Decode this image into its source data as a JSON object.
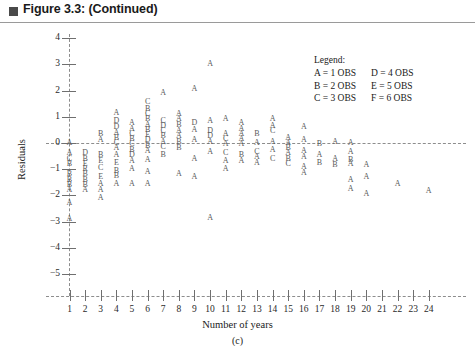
{
  "header": {
    "title": "Figure 3.3:  (Continued)",
    "bullet_icon": "filled-square-icon"
  },
  "legend": {
    "title": "Legend:",
    "rows": [
      {
        "left": "A = 1 OBS",
        "right": "D = 4 OBS"
      },
      {
        "left": "B = 2 OBS",
        "right": "E = 5 OBS"
      },
      {
        "left": "C = 3 OBS",
        "right": "F = 6 OBS"
      }
    ]
  },
  "axes": {
    "y_title": "Residuals",
    "x_title": "Number of years",
    "sub_caption": "(c)",
    "y_ticks": [
      4,
      3,
      2,
      1,
      0,
      -1,
      -2,
      -3,
      -4,
      -5
    ],
    "y_tick_labels": [
      "4",
      "3",
      "2",
      "1",
      "0",
      "−1",
      "−2",
      "−3",
      "−4",
      "−5"
    ],
    "x_ticks": [
      1,
      2,
      3,
      4,
      5,
      6,
      7,
      8,
      9,
      10,
      11,
      12,
      13,
      14,
      15,
      16,
      17,
      18,
      19,
      20,
      21,
      22,
      23,
      24
    ],
    "x_tick_labels": [
      "1",
      "2",
      "3",
      "4",
      "5",
      "6",
      "7",
      "8",
      "9",
      "10",
      "11",
      "12",
      "13",
      "14",
      "15",
      "16",
      "17",
      "18",
      "19",
      "20",
      "21",
      "22",
      "23",
      "24"
    ]
  },
  "chart_data": {
    "type": "scatter",
    "title": "Figure 3.3:  (Continued)",
    "xlabel": "Number of years",
    "ylabel": "Residuals",
    "sub_caption": "(c)",
    "xlim": [
      0.5,
      24.5
    ],
    "ylim": [
      -5.4,
      4.4
    ],
    "grid": false,
    "legend_position": "top-right",
    "legend_entries": [
      {
        "code": "A",
        "count": 1,
        "label": "A = 1 OBS"
      },
      {
        "code": "B",
        "count": 2,
        "label": "B = 2 OBS"
      },
      {
        "code": "C",
        "count": 3,
        "label": "C = 3 OBS"
      },
      {
        "code": "D",
        "count": 4,
        "label": "D = 4 OBS"
      },
      {
        "code": "E",
        "count": 5,
        "label": "E = 5 OBS"
      },
      {
        "code": "F",
        "count": 6,
        "label": "F = 6 OBS"
      }
    ],
    "annotations": [
      {
        "type": "reference-line",
        "axis": "y",
        "value": 0,
        "style": "dashed"
      }
    ],
    "points": [
      {
        "x": 1,
        "y": 0.0,
        "code": "A"
      },
      {
        "x": 1,
        "y": -0.4,
        "code": "A"
      },
      {
        "x": 1,
        "y": -0.6,
        "code": "C"
      },
      {
        "x": 1,
        "y": -0.8,
        "code": "B"
      },
      {
        "x": 1,
        "y": -1.2,
        "code": "B"
      },
      {
        "x": 1,
        "y": -1.4,
        "code": "B"
      },
      {
        "x": 1,
        "y": -1.6,
        "code": "B"
      },
      {
        "x": 1,
        "y": -1.8,
        "code": "A"
      },
      {
        "x": 1,
        "y": -2.3,
        "code": "A"
      },
      {
        "x": 1,
        "y": -2.9,
        "code": "A"
      },
      {
        "x": 2,
        "y": -0.4,
        "code": "D"
      },
      {
        "x": 2,
        "y": -0.6,
        "code": "B"
      },
      {
        "x": 2,
        "y": -0.8,
        "code": "E"
      },
      {
        "x": 2,
        "y": -1.0,
        "code": "R"
      },
      {
        "x": 2,
        "y": -1.2,
        "code": "B"
      },
      {
        "x": 2,
        "y": -1.4,
        "code": "B"
      },
      {
        "x": 2,
        "y": -1.6,
        "code": "B"
      },
      {
        "x": 2,
        "y": -1.8,
        "code": "A"
      },
      {
        "x": 3,
        "y": 0.35,
        "code": "B"
      },
      {
        "x": 3,
        "y": 0.1,
        "code": "A"
      },
      {
        "x": 3,
        "y": -0.45,
        "code": "B"
      },
      {
        "x": 3,
        "y": -0.7,
        "code": "E"
      },
      {
        "x": 3,
        "y": -0.95,
        "code": "C"
      },
      {
        "x": 3,
        "y": -1.3,
        "code": "E"
      },
      {
        "x": 3,
        "y": -1.55,
        "code": "A"
      },
      {
        "x": 3,
        "y": -1.8,
        "code": "A"
      },
      {
        "x": 3,
        "y": -2.1,
        "code": "A"
      },
      {
        "x": 4,
        "y": 1.15,
        "code": "A"
      },
      {
        "x": 4,
        "y": 0.85,
        "code": "D"
      },
      {
        "x": 4,
        "y": 0.6,
        "code": "D"
      },
      {
        "x": 4,
        "y": 0.4,
        "code": "A"
      },
      {
        "x": 4,
        "y": 0.2,
        "code": "B"
      },
      {
        "x": 4,
        "y": 0.0,
        "code": "C"
      },
      {
        "x": 4,
        "y": -0.2,
        "code": "A"
      },
      {
        "x": 4,
        "y": -0.45,
        "code": "A"
      },
      {
        "x": 4,
        "y": -0.75,
        "code": "E"
      },
      {
        "x": 4,
        "y": -1.05,
        "code": "B"
      },
      {
        "x": 4,
        "y": -1.25,
        "code": "B"
      },
      {
        "x": 4,
        "y": -1.55,
        "code": "A"
      },
      {
        "x": 5,
        "y": 0.75,
        "code": "A"
      },
      {
        "x": 5,
        "y": 0.55,
        "code": "A"
      },
      {
        "x": 5,
        "y": 0.35,
        "code": "C"
      },
      {
        "x": 5,
        "y": 0.15,
        "code": "B"
      },
      {
        "x": 5,
        "y": -0.05,
        "code": "C"
      },
      {
        "x": 5,
        "y": -0.25,
        "code": "B"
      },
      {
        "x": 5,
        "y": -0.45,
        "code": "D"
      },
      {
        "x": 5,
        "y": -0.7,
        "code": "A"
      },
      {
        "x": 5,
        "y": -1.0,
        "code": "A"
      },
      {
        "x": 5,
        "y": -1.55,
        "code": "A"
      },
      {
        "x": 6,
        "y": 1.55,
        "code": "C"
      },
      {
        "x": 6,
        "y": 1.3,
        "code": "B"
      },
      {
        "x": 6,
        "y": 1.1,
        "code": "C"
      },
      {
        "x": 6,
        "y": 0.9,
        "code": "B"
      },
      {
        "x": 6,
        "y": 0.7,
        "code": "A"
      },
      {
        "x": 6,
        "y": 0.5,
        "code": "B"
      },
      {
        "x": 6,
        "y": 0.3,
        "code": "E"
      },
      {
        "x": 6,
        "y": 0.1,
        "code": "D"
      },
      {
        "x": 6,
        "y": -0.1,
        "code": "B"
      },
      {
        "x": 6,
        "y": -0.3,
        "code": "A"
      },
      {
        "x": 6,
        "y": -0.65,
        "code": "A"
      },
      {
        "x": 6,
        "y": -1.1,
        "code": "A"
      },
      {
        "x": 6,
        "y": -1.55,
        "code": "A"
      },
      {
        "x": 7,
        "y": 1.9,
        "code": "A"
      },
      {
        "x": 7,
        "y": 0.85,
        "code": "C"
      },
      {
        "x": 7,
        "y": 0.65,
        "code": "D"
      },
      {
        "x": 7,
        "y": 0.45,
        "code": "C"
      },
      {
        "x": 7,
        "y": 0.25,
        "code": "B"
      },
      {
        "x": 7,
        "y": 0.05,
        "code": "A"
      },
      {
        "x": 7,
        "y": -0.15,
        "code": "C"
      },
      {
        "x": 7,
        "y": -0.45,
        "code": "B"
      },
      {
        "x": 8,
        "y": 1.1,
        "code": "A"
      },
      {
        "x": 8,
        "y": 0.9,
        "code": "A"
      },
      {
        "x": 8,
        "y": 0.7,
        "code": "B"
      },
      {
        "x": 8,
        "y": 0.45,
        "code": "A"
      },
      {
        "x": 8,
        "y": 0.25,
        "code": "A"
      },
      {
        "x": 8,
        "y": 0.05,
        "code": "B"
      },
      {
        "x": 8,
        "y": -0.2,
        "code": "B"
      },
      {
        "x": 8,
        "y": -1.2,
        "code": "A"
      },
      {
        "x": 9,
        "y": 2.05,
        "code": "A"
      },
      {
        "x": 9,
        "y": 0.75,
        "code": "D"
      },
      {
        "x": 9,
        "y": 0.5,
        "code": "A"
      },
      {
        "x": 9,
        "y": 0.1,
        "code": "A"
      },
      {
        "x": 9,
        "y": -0.6,
        "code": "A"
      },
      {
        "x": 9,
        "y": -1.3,
        "code": "A"
      },
      {
        "x": 10,
        "y": 3.0,
        "code": "A"
      },
      {
        "x": 10,
        "y": 0.85,
        "code": "A"
      },
      {
        "x": 10,
        "y": 0.45,
        "code": "D"
      },
      {
        "x": 10,
        "y": 0.25,
        "code": "D"
      },
      {
        "x": 10,
        "y": 0.05,
        "code": "A"
      },
      {
        "x": 10,
        "y": -0.35,
        "code": "A"
      },
      {
        "x": 10,
        "y": -2.85,
        "code": "A"
      },
      {
        "x": 11,
        "y": 0.9,
        "code": "A"
      },
      {
        "x": 11,
        "y": 0.35,
        "code": "A"
      },
      {
        "x": 11,
        "y": 0.15,
        "code": "C"
      },
      {
        "x": 11,
        "y": -0.05,
        "code": "A"
      },
      {
        "x": 11,
        "y": -0.4,
        "code": "C"
      },
      {
        "x": 11,
        "y": -0.7,
        "code": "A"
      },
      {
        "x": 11,
        "y": -1.0,
        "code": "A"
      },
      {
        "x": 12,
        "y": 0.75,
        "code": "A"
      },
      {
        "x": 12,
        "y": 0.55,
        "code": "A"
      },
      {
        "x": 12,
        "y": 0.35,
        "code": "A"
      },
      {
        "x": 12,
        "y": 0.15,
        "code": "A"
      },
      {
        "x": 12,
        "y": -0.05,
        "code": "A"
      },
      {
        "x": 12,
        "y": -0.45,
        "code": "B"
      },
      {
        "x": 12,
        "y": -0.7,
        "code": "A"
      },
      {
        "x": 13,
        "y": 0.35,
        "code": "B"
      },
      {
        "x": 13,
        "y": 0.0,
        "code": "A"
      },
      {
        "x": 13,
        "y": -0.35,
        "code": "C"
      },
      {
        "x": 13,
        "y": -0.55,
        "code": "A"
      },
      {
        "x": 13,
        "y": -0.75,
        "code": "A"
      },
      {
        "x": 14,
        "y": 0.9,
        "code": "A"
      },
      {
        "x": 14,
        "y": 0.65,
        "code": "A"
      },
      {
        "x": 14,
        "y": 0.45,
        "code": "C"
      },
      {
        "x": 14,
        "y": 0.05,
        "code": "A"
      },
      {
        "x": 14,
        "y": -0.25,
        "code": "A"
      },
      {
        "x": 14,
        "y": -0.6,
        "code": "C"
      },
      {
        "x": 15,
        "y": 0.2,
        "code": "A"
      },
      {
        "x": 15,
        "y": 0.0,
        "code": "A"
      },
      {
        "x": 15,
        "y": -0.2,
        "code": "B"
      },
      {
        "x": 15,
        "y": -0.4,
        "code": "A"
      },
      {
        "x": 15,
        "y": -0.6,
        "code": "B"
      },
      {
        "x": 15,
        "y": -0.8,
        "code": "C"
      },
      {
        "x": 16,
        "y": 0.6,
        "code": "A"
      },
      {
        "x": 16,
        "y": 0.1,
        "code": "A"
      },
      {
        "x": 16,
        "y": -0.3,
        "code": "A"
      },
      {
        "x": 16,
        "y": -0.55,
        "code": "A"
      },
      {
        "x": 16,
        "y": -0.9,
        "code": "A"
      },
      {
        "x": 16,
        "y": -1.15,
        "code": "A"
      },
      {
        "x": 17,
        "y": -0.05,
        "code": "B"
      },
      {
        "x": 17,
        "y": -0.45,
        "code": "A"
      },
      {
        "x": 17,
        "y": -0.75,
        "code": "B"
      },
      {
        "x": 18,
        "y": 0.05,
        "code": "A"
      },
      {
        "x": 18,
        "y": -0.6,
        "code": "A"
      },
      {
        "x": 18,
        "y": -0.85,
        "code": "B"
      },
      {
        "x": 19,
        "y": 0.0,
        "code": "A"
      },
      {
        "x": 19,
        "y": -0.35,
        "code": "A"
      },
      {
        "x": 19,
        "y": -0.65,
        "code": "B"
      },
      {
        "x": 19,
        "y": -0.8,
        "code": "A"
      },
      {
        "x": 19,
        "y": -1.4,
        "code": "A"
      },
      {
        "x": 19,
        "y": -1.75,
        "code": "A"
      },
      {
        "x": 20,
        "y": -0.85,
        "code": "A"
      },
      {
        "x": 20,
        "y": -1.3,
        "code": "A"
      },
      {
        "x": 20,
        "y": -1.95,
        "code": "A"
      },
      {
        "x": 22,
        "y": -1.55,
        "code": "A"
      },
      {
        "x": 24,
        "y": -1.85,
        "code": "A"
      }
    ]
  }
}
